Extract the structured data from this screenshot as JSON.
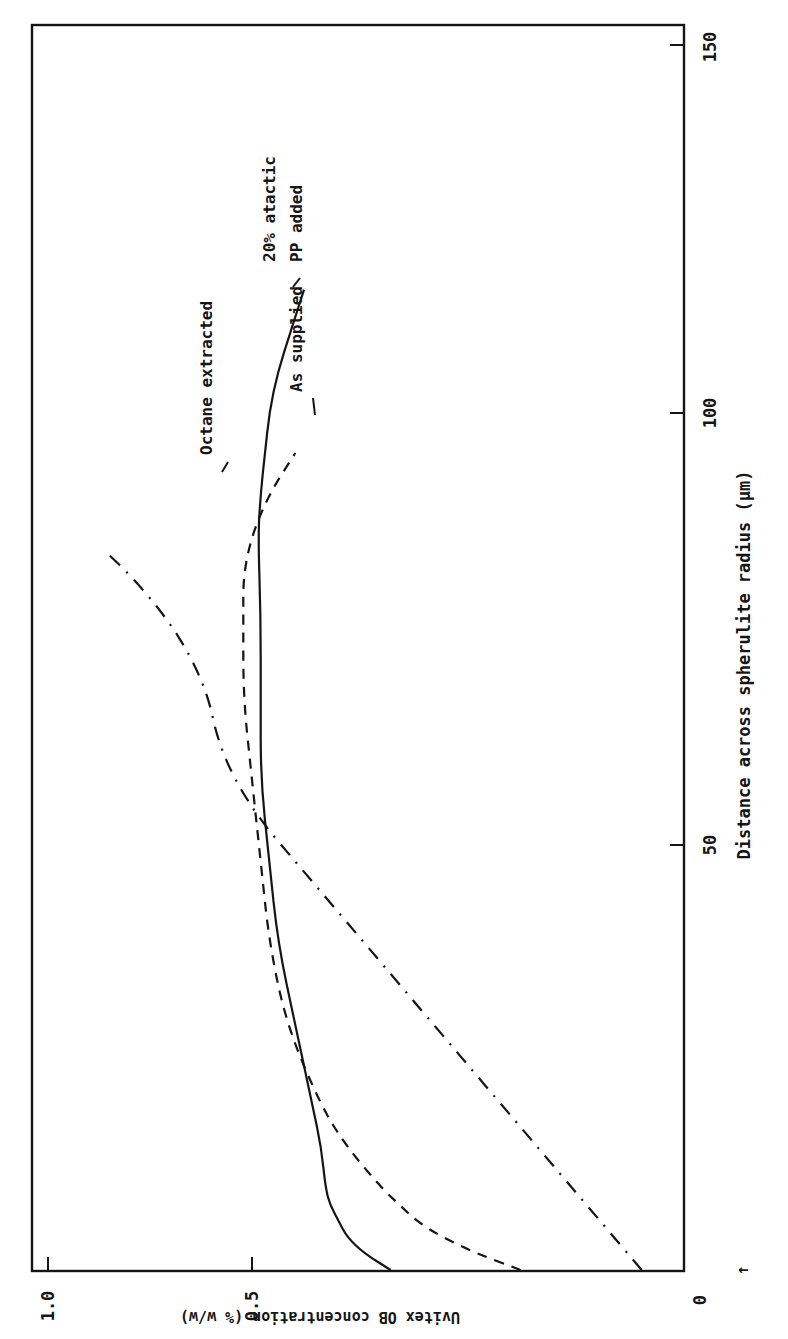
{
  "chart_data": {
    "type": "line",
    "orientation": "rotated-90-clockwise",
    "title": "",
    "xlabel": "Distance across spherulite radius (μm)",
    "ylabel": "Uvitex OB concentration (% w/w)",
    "xlim": [
      0,
      155
    ],
    "ylim": [
      0,
      1.05
    ],
    "x_ticks": [
      0,
      50,
      100,
      150
    ],
    "x_tick_labels": [
      "0",
      "50",
      "100",
      "150"
    ],
    "y_ticks": [
      0.5,
      1.0
    ],
    "y_tick_labels": [
      "0",
      "0.5",
      "1.0"
    ],
    "grid": false,
    "legend": "inline labels at curve ends",
    "x_origin_marker": "↑",
    "series": [
      {
        "name": "20% atactic PP added",
        "label_lines": [
          "20% atactic",
          "PP added"
        ],
        "style": "solid",
        "x": [
          0,
          2,
          4,
          6,
          8,
          10,
          15,
          20,
          30,
          40,
          50,
          60,
          70,
          80,
          90,
          95,
          100,
          105,
          110,
          115,
          120
        ],
        "y": [
          0.34,
          0.37,
          0.39,
          0.4,
          0.41,
          0.415,
          0.42,
          0.43,
          0.45,
          0.47,
          0.48,
          0.49,
          0.49,
          0.49,
          0.493,
          0.49,
          0.485,
          0.48,
          0.47,
          0.455,
          0.44
        ]
      },
      {
        "name": "As supplied",
        "label_lines": [
          "As supplied"
        ],
        "style": "dashed",
        "x": [
          0,
          2,
          4,
          6,
          8,
          10,
          15,
          20,
          30,
          40,
          50,
          60,
          70,
          80,
          85,
          90,
          95,
          100
        ],
        "y": [
          0.19,
          0.24,
          0.28,
          0.31,
          0.33,
          0.35,
          0.39,
          0.42,
          0.46,
          0.48,
          0.49,
          0.5,
          0.51,
          0.51,
          0.51,
          0.5,
          0.48,
          0.45
        ]
      },
      {
        "name": "Octane extracted",
        "label_lines": [
          "Octane extracted"
        ],
        "style": "dash-dot",
        "x": [
          0,
          5,
          10,
          15,
          20,
          25,
          30,
          35,
          40,
          45,
          50,
          55,
          60,
          65,
          70,
          75,
          80,
          85,
          88
        ],
        "y": [
          0.05,
          0.09,
          0.13,
          0.17,
          0.21,
          0.25,
          0.29,
          0.33,
          0.37,
          0.41,
          0.45,
          0.49,
          0.52,
          0.54,
          0.55,
          0.57,
          0.6,
          0.64,
          0.67
        ]
      }
    ]
  },
  "axis_text": {
    "x_label": "Distance across spherulite radius (μm)",
    "y_label": "Uvitex OB concentration (% w/w)",
    "x_tick_0": "0",
    "x_tick_50": "50",
    "x_tick_100": "100",
    "x_tick_150": "150",
    "y_tick_0": "0",
    "y_tick_05": "0.5",
    "y_tick_10": "1.0",
    "origin_marker": "↑"
  },
  "labels": {
    "atactic_line1": "20% atactic",
    "atactic_line2": "PP added",
    "as_supplied": "As supplied",
    "octane": "Octane extracted"
  },
  "colors": {
    "ink": "#151515",
    "background": "#ffffff"
  }
}
